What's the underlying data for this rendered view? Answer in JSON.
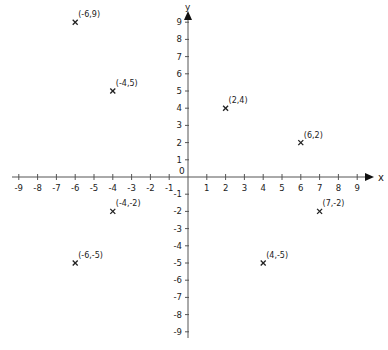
{
  "chart_data": {
    "type": "scatter",
    "title": "",
    "xlabel": "x",
    "ylabel": "y",
    "xlim": [
      -9,
      9
    ],
    "ylim": [
      -9,
      9
    ],
    "grid": false,
    "origin_label": "0",
    "x_ticks": [
      -9,
      -8,
      -7,
      -6,
      -5,
      -4,
      -3,
      -2,
      -1,
      1,
      2,
      3,
      4,
      5,
      6,
      7,
      8,
      9
    ],
    "y_ticks": [
      9,
      8,
      7,
      6,
      5,
      4,
      3,
      2,
      1,
      -1,
      -2,
      -3,
      -4,
      -5,
      -6,
      -7,
      -8,
      -9
    ],
    "marker": "x",
    "points": [
      {
        "x": -6,
        "y": 9,
        "label": "(-6,9)"
      },
      {
        "x": -4,
        "y": 5,
        "label": "(-4,5)"
      },
      {
        "x": 2,
        "y": 4,
        "label": "(2,4)"
      },
      {
        "x": 6,
        "y": 2,
        "label": "(6,2)"
      },
      {
        "x": -4,
        "y": -2,
        "label": "(-4,-2)"
      },
      {
        "x": 7,
        "y": -2,
        "label": "(7,-2)"
      },
      {
        "x": -6,
        "y": -5,
        "label": "(-6,-5)"
      },
      {
        "x": 4,
        "y": -5,
        "label": "(4,-5)"
      }
    ]
  },
  "colors": {
    "axis": "#555555",
    "text": "#222222",
    "marker": "#222222"
  }
}
